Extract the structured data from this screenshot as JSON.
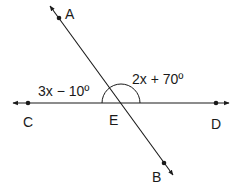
{
  "diagram": {
    "type": "intersecting-lines",
    "stroke_color": "#1a1a1a",
    "points": {
      "A": {
        "label": "A",
        "x": 59,
        "y": 18
      },
      "B": {
        "label": "B",
        "x": 164,
        "y": 163
      },
      "C": {
        "label": "C",
        "x": 28,
        "y": 103
      },
      "D": {
        "label": "D",
        "x": 216,
        "y": 103
      },
      "E": {
        "label": "E",
        "x": 121,
        "y": 103
      }
    },
    "lines": [
      {
        "name": "line-AB",
        "through": [
          "A",
          "E",
          "B"
        ],
        "arrows": "both"
      },
      {
        "name": "line-CD",
        "through": [
          "C",
          "E",
          "D"
        ],
        "arrows": "both"
      }
    ],
    "angles": {
      "CEA": {
        "expression": "3x − 10º"
      },
      "AED": {
        "expression": "2x + 70º"
      }
    },
    "arc": {
      "center": "E",
      "radius": 19,
      "spans": "C-to-D upper semicircle"
    }
  }
}
